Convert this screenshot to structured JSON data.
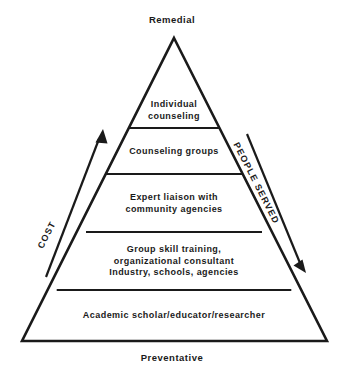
{
  "diagram": {
    "type": "pyramid",
    "title_top": "Remedial",
    "title_bottom": "Preventative",
    "stroke_color": "#1a1a1a",
    "fill_color": "#ffffff",
    "apex": {
      "x": 174,
      "y": 38
    },
    "base_left": {
      "x": 22,
      "y": 341
    },
    "base_right": {
      "x": 327,
      "y": 341
    },
    "divider_y": [
      128,
      174,
      232,
      290
    ],
    "tiers": [
      {
        "index": 1,
        "name": "individual-counseling",
        "lines": [
          "Individual",
          "counseling"
        ],
        "center_x": 174,
        "center_y": 110
      },
      {
        "index": 2,
        "name": "counseling-groups",
        "lines": [
          "Counseling  groups"
        ],
        "center_x": 174,
        "center_y": 152
      },
      {
        "index": 3,
        "name": "expert-liaison",
        "lines": [
          "Expert liaison with",
          "community  agencies"
        ],
        "center_x": 174,
        "center_y": 203
      },
      {
        "index": 4,
        "name": "group-skill-training",
        "lines": [
          "Group skill training,",
          "organizational  consultant",
          "Industry,  schools,  agencies"
        ],
        "center_x": 174,
        "center_y": 261
      },
      {
        "index": 5,
        "name": "academic-scholar",
        "lines": [
          "Academic  scholar/educator/researcher"
        ],
        "center_x": 174,
        "center_y": 316
      }
    ],
    "axes": [
      {
        "name": "cost",
        "label": "COST",
        "direction": "up",
        "from": {
          "x": 48,
          "y": 272
        },
        "to": {
          "x": 103,
          "y": 130
        }
      },
      {
        "name": "people-served",
        "label": "PEOPLE SERVED",
        "direction": "down",
        "from": {
          "x": 244,
          "y": 131
        },
        "to": {
          "x": 304,
          "y": 272
        }
      }
    ]
  }
}
